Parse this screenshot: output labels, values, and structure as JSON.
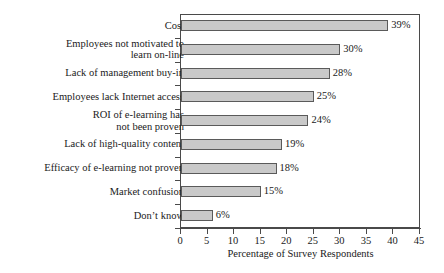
{
  "chart_data": {
    "type": "bar",
    "orientation": "horizontal",
    "title": "",
    "xlabel": "Percentage of Survey Respondents",
    "ylabel": "",
    "xlim": [
      0,
      45
    ],
    "xticks": [
      0,
      5,
      10,
      15,
      20,
      25,
      30,
      35,
      40,
      45
    ],
    "grid": false,
    "legend": null,
    "bar_color": "#c9c9c9",
    "bar_border_color": "#5a5a5a",
    "axis_color": "#4a4a4a",
    "value_suffix": "%",
    "categories": [
      "Cost",
      "Employees not motivated to\nlearn on-line",
      "Lack of management buy-in",
      "Employees lack Internet access",
      "ROI of e-learning has\nnot been proven",
      "Lack of high-quality content",
      "Efficacy of e-learning not proven",
      "Market confusion",
      "Don’t know"
    ],
    "values": [
      39,
      30,
      28,
      25,
      24,
      19,
      18,
      15,
      6
    ],
    "value_labels": [
      "39%",
      "30%",
      "28%",
      "25%",
      "24%",
      "19%",
      "18%",
      "15%",
      "6%"
    ],
    "bars": [
      {
        "label": "Cost",
        "lines": 1,
        "value": 39,
        "value_label": "39%"
      },
      {
        "label": "Employees not motivated to\nlearn on-line",
        "lines": 2,
        "value": 30,
        "value_label": "30%"
      },
      {
        "label": "Lack of management buy-in",
        "lines": 1,
        "value": 28,
        "value_label": "28%"
      },
      {
        "label": "Employees lack Internet access",
        "lines": 1,
        "value": 25,
        "value_label": "25%"
      },
      {
        "label": "ROI of e-learning has\nnot been proven",
        "lines": 2,
        "value": 24,
        "value_label": "24%"
      },
      {
        "label": "Lack of high-quality content",
        "lines": 1,
        "value": 19,
        "value_label": "19%"
      },
      {
        "label": "Efficacy of e-learning not proven",
        "lines": 1,
        "value": 18,
        "value_label": "18%"
      },
      {
        "label": "Market confusion",
        "lines": 1,
        "value": 15,
        "value_label": "15%"
      },
      {
        "label": "Don’t know",
        "lines": 1,
        "value": 6,
        "value_label": "6%"
      }
    ]
  }
}
